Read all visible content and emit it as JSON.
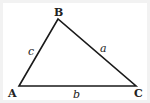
{
  "diagram": {
    "type": "triangle",
    "colors": {
      "stroke": "#1a1a1a",
      "background": "#ffffff",
      "border": "#f2f2f2"
    },
    "vertices": {
      "A": {
        "label": "A",
        "x": 19,
        "y": 86
      },
      "B": {
        "label": "B",
        "x": 58,
        "y": 19
      },
      "C": {
        "label": "C",
        "x": 136,
        "y": 86
      }
    },
    "sides": {
      "a": {
        "label": "a",
        "between": [
          "B",
          "C"
        ]
      },
      "b": {
        "label": "b",
        "between": [
          "A",
          "C"
        ]
      },
      "c": {
        "label": "c",
        "between": [
          "A",
          "B"
        ]
      }
    }
  }
}
